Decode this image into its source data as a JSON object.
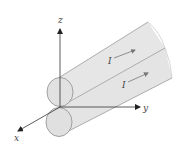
{
  "diagram": {
    "axes": {
      "x_label": "x",
      "y_label": "y",
      "z_label": "z"
    },
    "currents": [
      {
        "label": "I",
        "conductor": "upper"
      },
      {
        "label": "I",
        "conductor": "lower"
      }
    ],
    "colors": {
      "cylinder_fill": "#e4e4e4",
      "cylinder_stroke": "#9a9a9a",
      "axis": "#333333",
      "arrow": "#666666"
    }
  }
}
